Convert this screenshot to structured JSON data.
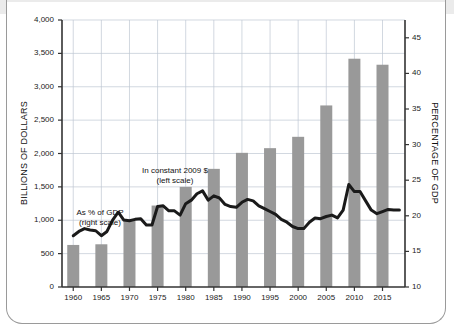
{
  "figure": {
    "bar_color": "#999999",
    "line_color": "#1a1a1a",
    "grid_color": "#bfc7d2",
    "axis_color": "#333333",
    "card_border_color": "#9a9a9a",
    "top_band_color": "#ebebeb"
  },
  "annotations": {
    "bars_line1": "In constant 2009 $",
    "bars_line2": "(left scale)",
    "line_line1": "As % of GDP",
    "line_line2": "(right scale)"
  },
  "chart_data": {
    "type": "bar",
    "title": "",
    "xlabel": "",
    "ylabel": "BILLIONS OF DOLLARS",
    "y2label": "PERCENTAGE OF GDP",
    "grid": true,
    "legend": "annotations-inline",
    "ylim": [
      0,
      4000
    ],
    "y2lim": [
      10,
      47.5
    ],
    "yticks": [
      0,
      500,
      1000,
      1500,
      2000,
      2500,
      3000,
      3500,
      4000
    ],
    "ytick_labels": [
      "0",
      "500",
      "1,000",
      "1,500",
      "2,000",
      "2,500",
      "3,000",
      "3,500",
      "4,000"
    ],
    "y2ticks": [
      10,
      15,
      20,
      25,
      30,
      35,
      40,
      45
    ],
    "y2tick_labels": [
      "10",
      "15",
      "20",
      "25",
      "30",
      "35",
      "40",
      "45"
    ],
    "categories": [
      "1960",
      "1965",
      "1970",
      "1975",
      "1980",
      "1985",
      "1990",
      "1995",
      "2000",
      "2005",
      "2010",
      "2015"
    ],
    "xtick_labels": [
      "1960",
      "1965",
      "1970",
      "1975",
      "1980",
      "1985",
      "1990",
      "1995",
      "2000",
      "2005",
      "2010",
      "2015"
    ],
    "series": [
      {
        "name": "In constant 2009 $ (left scale)",
        "type": "bar",
        "axis": "left",
        "unit": "billions of dollars",
        "x": [
          1960,
          1965,
          1970,
          1975,
          1980,
          1985,
          1990,
          1995,
          2000,
          2005,
          2010,
          2015
        ],
        "values": [
          630,
          640,
          1000,
          1220,
          1500,
          1770,
          2010,
          2080,
          2250,
          2720,
          3420,
          3330
        ]
      },
      {
        "name": "As % of GDP (right scale)",
        "type": "line",
        "axis": "right",
        "unit": "percent of GDP",
        "x": [
          1960,
          1961,
          1962,
          1963,
          1964,
          1965,
          1966,
          1967,
          1968,
          1969,
          1970,
          1971,
          1972,
          1973,
          1974,
          1975,
          1976,
          1977,
          1978,
          1979,
          1980,
          1981,
          1982,
          1983,
          1984,
          1985,
          1986,
          1987,
          1988,
          1989,
          1990,
          1991,
          1992,
          1993,
          1994,
          1995,
          1996,
          1997,
          1998,
          1999,
          2000,
          2001,
          2002,
          2003,
          2004,
          2005,
          2006,
          2007,
          2008,
          2009,
          2010,
          2011,
          2012,
          2013,
          2014,
          2015,
          2016,
          2017,
          2018
        ],
        "values": [
          17.2,
          17.8,
          18.2,
          18.0,
          17.9,
          17.2,
          17.8,
          19.4,
          20.5,
          19.4,
          19.3,
          19.5,
          19.6,
          18.7,
          18.7,
          21.3,
          21.4,
          20.7,
          20.7,
          20.1,
          21.7,
          22.2,
          23.1,
          23.5,
          22.2,
          22.8,
          22.5,
          21.6,
          21.3,
          21.2,
          21.9,
          22.3,
          22.1,
          21.4,
          21.0,
          20.6,
          20.2,
          19.5,
          19.1,
          18.5,
          18.2,
          18.2,
          19.1,
          19.7,
          19.6,
          19.9,
          20.1,
          19.7,
          20.8,
          24.4,
          23.4,
          23.4,
          22.1,
          20.8,
          20.3,
          20.6,
          20.9,
          20.8,
          20.8
        ]
      }
    ]
  }
}
